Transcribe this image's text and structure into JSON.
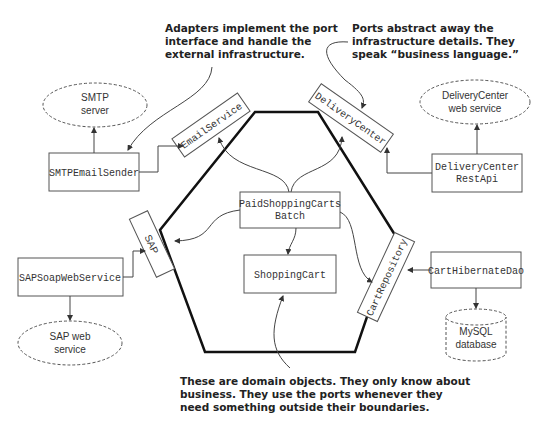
{
  "notes": {
    "adapters": [
      "Adapters implement the port",
      "interface and handle the",
      "external infrastructure."
    ],
    "ports": [
      "Ports abstract away the",
      "infrastructure details. They",
      "speak “business language.”"
    ],
    "domain": [
      "These are domain objects. They only know about",
      "business. They use the ports whenever they",
      "need something outside their boundaries."
    ]
  },
  "ports": {
    "email": "EmailService",
    "delivery": "DeliveryCenter",
    "sap": "SAP",
    "cart_repo": "CartRepository"
  },
  "domain": {
    "batch": [
      "PaidShoppingCarts",
      "Batch"
    ],
    "cart": "ShoppingCart"
  },
  "adapters": {
    "smtp_sender": "SMTPEmailSender",
    "delivery_api": [
      "DeliveryCenter",
      "RestApi"
    ],
    "sap_soap": "SAPSoapWebService",
    "cart_dao": "CartHibernateDao"
  },
  "infrastructure": {
    "smtp_server": [
      "SMTP",
      "server"
    ],
    "delivery_ws": [
      "DeliveryCenter",
      "web service"
    ],
    "sap_ws": [
      "SAP web",
      "service"
    ],
    "mysql": [
      "MySQL",
      "database"
    ]
  }
}
